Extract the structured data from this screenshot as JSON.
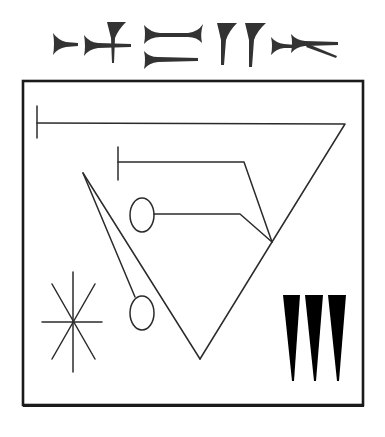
{
  "title": "Cuneiform inscription with schematic diagram",
  "colors": {
    "background": "#ffffff",
    "ink": "#2b2b2b",
    "wedge": "#333333",
    "frame": "#1a1a1a",
    "solid_wedge": "#000000"
  },
  "inscription": {
    "description": "Row of cuneiform signs above the framed diagram",
    "signs": [
      {
        "id": 1,
        "type": "horizontal-wedge"
      },
      {
        "id": 2,
        "type": "horizontal-wedge-with-vertical-wedge"
      },
      {
        "id": 3,
        "type": "double-headed-horizontal-over-horizontal-wedge"
      },
      {
        "id": 4,
        "type": "two-vertical-wedges"
      },
      {
        "id": 5,
        "type": "two-horizontal-wedges-with-diagonal"
      }
    ]
  },
  "diagram": {
    "frame": {
      "x": 22,
      "y": 80,
      "width": 342,
      "height": 326
    },
    "elements": [
      {
        "name": "long-bar",
        "type": "line-with-tick"
      },
      {
        "name": "short-bar",
        "type": "line-with-tick"
      },
      {
        "name": "upper-circle",
        "type": "ellipse"
      },
      {
        "name": "lower-circle",
        "type": "ellipse"
      },
      {
        "name": "large-triangle",
        "type": "polyline"
      },
      {
        "name": "star",
        "type": "eight-point-star"
      },
      {
        "name": "three-wedges",
        "type": "vertical-wedges",
        "count": 3
      }
    ]
  }
}
